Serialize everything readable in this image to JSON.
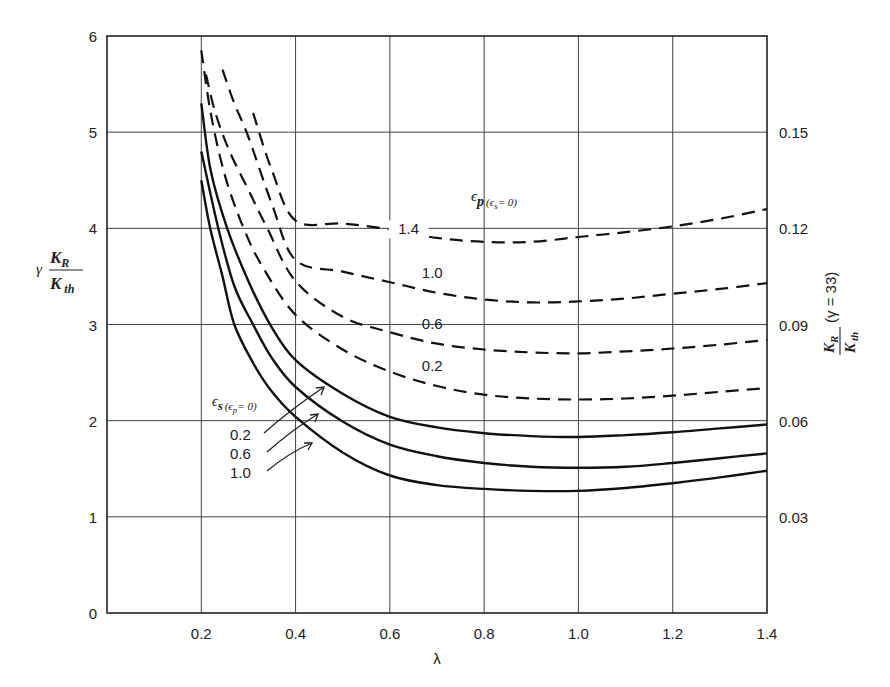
{
  "chart_data": {
    "type": "line",
    "title": "",
    "xlabel": "λ",
    "ylabel": {
      "prefix": "γ",
      "numerator": "K",
      "numerator_sub": "R",
      "denominator": "K",
      "denominator_sub": "th"
    },
    "y2label": {
      "numerator": "K",
      "numerator_sub": "R",
      "denominator": "K",
      "denominator_sub": "th",
      "suffix": "(γ = 33)"
    },
    "xlim": [
      0,
      1.4
    ],
    "ylim": [
      0,
      6
    ],
    "y2lim": [
      0,
      0.18
    ],
    "grid": true,
    "x_ticks": [
      0.2,
      0.4,
      0.6,
      0.8,
      1.0,
      1.2,
      1.4
    ],
    "x_tick_labels": [
      "0.2",
      "0.4",
      "0.6",
      "0.8",
      "1.0",
      "1.2",
      "1.4"
    ],
    "y_ticks": [
      0,
      1,
      2,
      3,
      4,
      5,
      6
    ],
    "y_tick_labels": [
      "0",
      "1",
      "2",
      "3",
      "4",
      "5",
      "6"
    ],
    "y2_ticks": [
      1,
      2,
      3,
      4,
      5
    ],
    "y2_tick_labels": [
      "0.03",
      "0.06",
      "0.09",
      "0.12",
      "0.15"
    ],
    "legend_groups": [
      {
        "style": "dashed",
        "title": {
          "main": "ϵ",
          "main_sub": "p",
          "cond": "(ϵ",
          "cond_sub": "s",
          "cond_end": "= 0)"
        },
        "placement": "upper-middle"
      },
      {
        "style": "solid",
        "title": {
          "main": "ϵ",
          "main_sub": "s",
          "cond": "(ϵ",
          "cond_sub": "p",
          "cond_end": "= 0)"
        },
        "placement": "middle-left"
      }
    ],
    "series": [
      {
        "name": "ϵp = 1.4 (ϵs = 0)",
        "label": "1.4",
        "style": "dashed",
        "x": [
          0.31,
          0.35,
          0.4,
          0.5,
          0.6,
          0.7,
          0.8,
          0.9,
          1.0,
          1.1,
          1.2,
          1.3,
          1.4
        ],
        "y": [
          5.2,
          4.6,
          4.08,
          4.05,
          3.99,
          3.9,
          3.86,
          3.86,
          3.91,
          3.96,
          4.02,
          4.1,
          4.2
        ]
      },
      {
        "name": "ϵp = 1.0 (ϵs = 0)",
        "label": "1.0",
        "style": "dashed",
        "x": [
          0.245,
          0.27,
          0.3,
          0.35,
          0.4,
          0.5,
          0.6,
          0.7,
          0.8,
          0.9,
          1.0,
          1.1,
          1.2,
          1.3,
          1.4
        ],
        "y": [
          5.65,
          5.3,
          4.95,
          4.25,
          3.67,
          3.55,
          3.44,
          3.33,
          3.26,
          3.23,
          3.24,
          3.27,
          3.32,
          3.37,
          3.43
        ],
        "label_at": 0.9
      },
      {
        "name": "ϵp = 0.6 (ϵs = 0)",
        "label": "0.6",
        "style": "dashed",
        "x": [
          0.21,
          0.23,
          0.26,
          0.3,
          0.34,
          0.4,
          0.5,
          0.6,
          0.7,
          0.8,
          0.9,
          1.0,
          1.1,
          1.2,
          1.3,
          1.4
        ],
        "y": [
          5.6,
          5.2,
          4.8,
          4.4,
          4.0,
          3.45,
          3.08,
          2.92,
          2.8,
          2.74,
          2.71,
          2.7,
          2.72,
          2.75,
          2.79,
          2.84
        ],
        "label_at": 0.9
      },
      {
        "name": "ϵp = 0.2 (ϵs = 0)",
        "label": "0.2",
        "style": "dashed",
        "x": [
          0.2,
          0.22,
          0.25,
          0.29,
          0.33,
          0.4,
          0.5,
          0.6,
          0.7,
          0.8,
          0.9,
          1.0,
          1.1,
          1.2,
          1.3,
          1.4
        ],
        "y": [
          5.85,
          5.2,
          4.55,
          4.0,
          3.6,
          3.1,
          2.74,
          2.51,
          2.36,
          2.27,
          2.23,
          2.22,
          2.23,
          2.26,
          2.3,
          2.34
        ],
        "label_at": 0.9
      },
      {
        "name": "ϵs = 0.2 (ϵp = 0)",
        "label": "0.2",
        "style": "solid",
        "x": [
          0.2,
          0.22,
          0.255,
          0.3,
          0.346,
          0.4,
          0.5,
          0.6,
          0.7,
          0.8,
          0.9,
          1.0,
          1.1,
          1.2,
          1.3,
          1.4
        ],
        "y": [
          5.3,
          4.6,
          4.0,
          3.45,
          3.0,
          2.63,
          2.28,
          2.04,
          1.93,
          1.87,
          1.84,
          1.83,
          1.85,
          1.88,
          1.92,
          1.96
        ]
      },
      {
        "name": "ϵs = 0.6 (ϵp = 0)",
        "label": "0.6",
        "style": "solid",
        "x": [
          0.2,
          0.236,
          0.27,
          0.31,
          0.35,
          0.4,
          0.5,
          0.6,
          0.7,
          0.8,
          0.9,
          1.0,
          1.1,
          1.2,
          1.3,
          1.4
        ],
        "y": [
          4.8,
          4.0,
          3.4,
          3.0,
          2.65,
          2.35,
          1.99,
          1.75,
          1.63,
          1.56,
          1.52,
          1.51,
          1.52,
          1.56,
          1.61,
          1.66
        ]
      },
      {
        "name": "ϵs = 1.0 (ϵp = 0)",
        "label": "1.0",
        "style": "solid",
        "x": [
          0.2,
          0.219,
          0.245,
          0.27,
          0.31,
          0.35,
          0.4,
          0.5,
          0.6,
          0.7,
          0.8,
          0.9,
          1.0,
          1.1,
          1.2,
          1.3,
          1.4
        ],
        "y": [
          4.5,
          4.0,
          3.5,
          3.0,
          2.6,
          2.3,
          2.04,
          1.67,
          1.43,
          1.33,
          1.29,
          1.27,
          1.27,
          1.3,
          1.35,
          1.41,
          1.48
        ]
      }
    ],
    "solid_labels": [
      "0.2",
      "0.6",
      "1.0"
    ]
  }
}
